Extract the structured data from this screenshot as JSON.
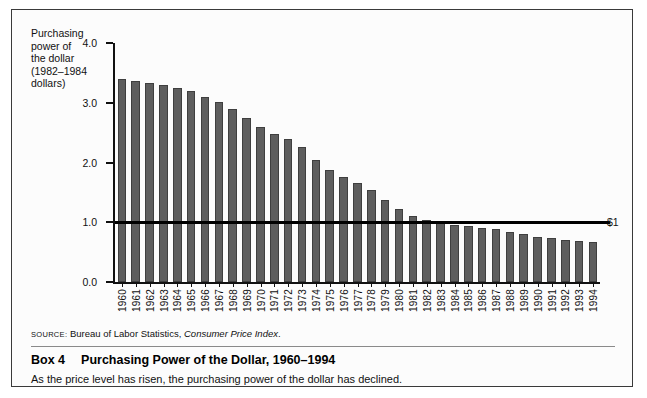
{
  "figure": {
    "y_axis_title": "Purchasing\npower of\nthe dollar\n(1982–1984\ndollars)",
    "source_prefix": "SOURCE:",
    "source_text": " Bureau of Labor Statistics, ",
    "source_italic": "Consumer Price Index",
    "source_suffix": ".",
    "box_number": "Box 4",
    "box_title": "Purchasing Power of the Dollar, 1960–1994",
    "caption": "As the price level has risen, the purchasing power of the dollar has declined.",
    "reference_label": "$1"
  },
  "chart_data": {
    "type": "bar",
    "title": "Purchasing Power of the Dollar, 1960–1994",
    "xlabel": "",
    "ylabel": "Purchasing power of the dollar (1982–1984 dollars)",
    "ylim": [
      0.0,
      4.0
    ],
    "yticks": [
      "0.0",
      "1.0",
      "2.0",
      "3.0",
      "4.0"
    ],
    "ytick_values": [
      0.0,
      1.0,
      2.0,
      3.0,
      4.0
    ],
    "grid": false,
    "legend": "none",
    "bar_color": "#5e5e5e",
    "reference_line": {
      "value": 1.0,
      "label": "$1",
      "color": "#000000"
    },
    "categories": [
      "1960",
      "1961",
      "1962",
      "1963",
      "1964",
      "1965",
      "1966",
      "1967",
      "1968",
      "1969",
      "1970",
      "1971",
      "1972",
      "1973",
      "1974",
      "1975",
      "1976",
      "1977",
      "1978",
      "1979",
      "1980",
      "1981",
      "1982",
      "1983",
      "1984",
      "1985",
      "1986",
      "1987",
      "1988",
      "1989",
      "1990",
      "1991",
      "1992",
      "1993",
      "1994"
    ],
    "values": [
      3.4,
      3.37,
      3.33,
      3.29,
      3.25,
      3.19,
      3.1,
      3.01,
      2.89,
      2.74,
      2.59,
      2.48,
      2.4,
      2.26,
      2.04,
      1.87,
      1.76,
      1.66,
      1.54,
      1.38,
      1.22,
      1.1,
      1.04,
      1.0,
      0.96,
      0.93,
      0.91,
      0.88,
      0.84,
      0.8,
      0.76,
      0.73,
      0.71,
      0.69,
      0.67
    ]
  }
}
